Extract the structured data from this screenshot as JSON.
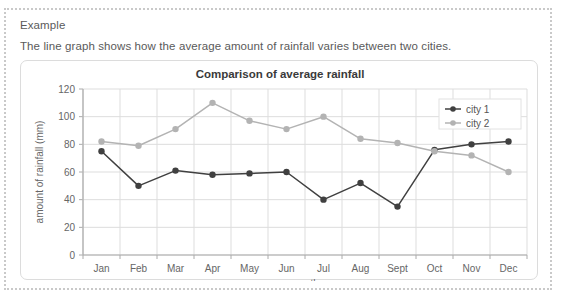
{
  "page": {
    "example_label": "Example",
    "intro_text": "The line graph shows how the average amount of rainfall varies between two cities."
  },
  "colors": {
    "series1": "#404040",
    "series2": "#b3b3b3",
    "grid": "#dddddd",
    "axis": "#aaaaaa",
    "panel_border": "#dcdcdc",
    "outer_border": "#c9c9c9",
    "text": "#5a5a5a"
  },
  "chart_data": {
    "type": "line",
    "title": "Comparison of average rainfall",
    "xlabel": "month",
    "ylabel": "amount of rainfall (mm)",
    "categories": [
      "Jan",
      "Feb",
      "Mar",
      "Apr",
      "May",
      "Jun",
      "Jul",
      "Aug",
      "Sept",
      "Oct",
      "Nov",
      "Dec"
    ],
    "ylim": [
      0,
      120
    ],
    "yticks": [
      0,
      20,
      40,
      60,
      80,
      100,
      120
    ],
    "grid": true,
    "legend_position": "top-right",
    "series": [
      {
        "name": "city 1",
        "values": [
          75,
          50,
          61,
          58,
          59,
          60,
          40,
          52,
          35,
          76,
          80,
          82
        ]
      },
      {
        "name": "city 2",
        "values": [
          82,
          79,
          91,
          110,
          97,
          91,
          100,
          84,
          81,
          75,
          72,
          60
        ]
      }
    ]
  }
}
